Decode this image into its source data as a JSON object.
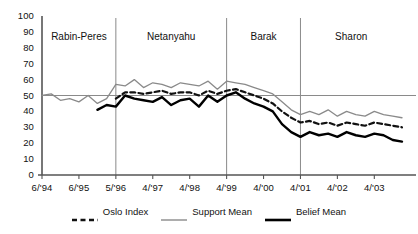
{
  "chart_data": {
    "type": "line",
    "title": "",
    "xlabel": "",
    "ylabel": "",
    "ylim": [
      0,
      100
    ],
    "ytick_step": 10,
    "grid": false,
    "reference_line_y": 50,
    "legend_position": "bottom",
    "yticks": [
      "100",
      "90",
      "80",
      "70",
      "60",
      "50",
      "40",
      "30",
      "20",
      "10",
      "0"
    ],
    "xticks": [
      "6/'94",
      "6/'95",
      "5/'96",
      "4/'97",
      "4/'98",
      "4/'99",
      "4/'00",
      "4/'01",
      "4/'02",
      "4/'03"
    ],
    "x": [
      "6/'94",
      "9/'94",
      "12/'94",
      "3/'95",
      "6/'95",
      "9/'95",
      "12/'95",
      "3/'96",
      "5/'96",
      "8/'96",
      "11/'96",
      "2/'97",
      "4/'97",
      "7/'97",
      "10/'97",
      "1/'98",
      "4/'98",
      "7/'98",
      "10/'98",
      "1/'99",
      "4/'99",
      "7/'99",
      "10/'99",
      "1/'00",
      "4/'00",
      "7/'00",
      "10/'00",
      "1/'01",
      "4/'01",
      "7/'01",
      "10/'01",
      "1/'02",
      "4/'02",
      "7/'02",
      "10/'02",
      "1/'03",
      "4/'03",
      "7/'03",
      "10/'03",
      "12/'03"
    ],
    "periods": [
      {
        "label": "Rabin-Peres",
        "start_x": "6/'94",
        "end_x": "5/'96"
      },
      {
        "label": "Netanyahu",
        "start_x": "5/'96",
        "end_x": "4/'99"
      },
      {
        "label": "Barak",
        "start_x": "4/'99",
        "end_x": "4/'01"
      },
      {
        "label": "Sharon",
        "start_x": "4/'01",
        "end_x": "12/'03"
      }
    ],
    "series": [
      {
        "name": "Oslo Index",
        "style": "dashed",
        "color": "#111111",
        "width": 2.2,
        "values": [
          null,
          null,
          null,
          null,
          null,
          null,
          null,
          null,
          48,
          52,
          52,
          51,
          52,
          53,
          51,
          52,
          52,
          50,
          53,
          51,
          53,
          54,
          52,
          50,
          48,
          45,
          40,
          36,
          33,
          34,
          32,
          33,
          31,
          33,
          32,
          31,
          33,
          32,
          31,
          30
        ]
      },
      {
        "name": "Support Mean",
        "style": "solid",
        "color": "#8a8a8a",
        "width": 1.3,
        "values": [
          50,
          51,
          47,
          48,
          46,
          50,
          45,
          48,
          57,
          56,
          60,
          55,
          58,
          57,
          55,
          58,
          57,
          56,
          59,
          54,
          59,
          58,
          57,
          55,
          53,
          51,
          46,
          41,
          38,
          40,
          38,
          41,
          37,
          40,
          38,
          37,
          40,
          38,
          37,
          36
        ]
      },
      {
        "name": "Belief Mean",
        "style": "solid",
        "color": "#000000",
        "width": 2.4,
        "values": [
          null,
          null,
          null,
          null,
          null,
          null,
          41,
          44,
          43,
          50,
          48,
          47,
          46,
          49,
          44,
          47,
          48,
          43,
          50,
          46,
          50,
          52,
          48,
          45,
          43,
          40,
          32,
          27,
          24,
          27,
          25,
          26,
          24,
          27,
          25,
          24,
          26,
          25,
          22,
          21
        ]
      }
    ]
  },
  "legend": {
    "items": [
      {
        "label": "Oslo Index",
        "swatch": "dashed-black-line"
      },
      {
        "label": "Support Mean",
        "swatch": "thin-gray-line"
      },
      {
        "label": "Belief Mean",
        "swatch": "thick-black-line"
      }
    ]
  },
  "colors": {
    "axis": "#555555",
    "divider": "#8a8a8a",
    "reference_line": "#8a8a8a",
    "oslo_index": "#111111",
    "support_mean": "#8a8a8a",
    "belief_mean": "#000000",
    "background": "#ffffff"
  }
}
